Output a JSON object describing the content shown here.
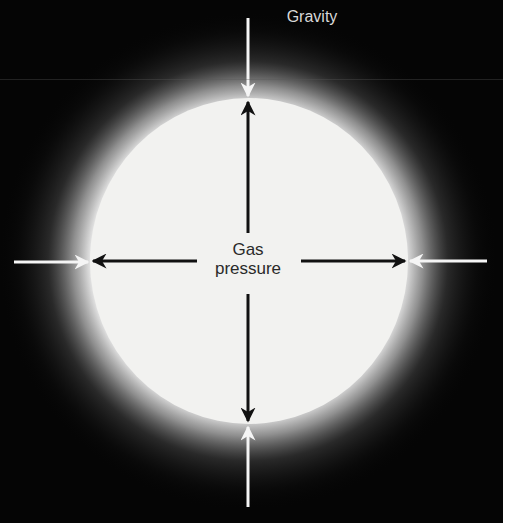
{
  "diagram": {
    "labels": {
      "gravity": "Gravity",
      "gas_pressure_line1": "Gas",
      "gas_pressure_line2": "pressure"
    },
    "star": {
      "shape": "circle",
      "fill": "#f2f2f0",
      "glow": "white halo fading to black"
    },
    "arrows": {
      "gravity": {
        "color": "#f5f5f5",
        "direction": "inward",
        "count": 4,
        "positions": [
          "top",
          "right",
          "bottom",
          "left"
        ]
      },
      "gas_pressure": {
        "color": "#111111",
        "direction": "outward",
        "count": 4,
        "positions": [
          "up",
          "right",
          "down",
          "left"
        ]
      }
    },
    "colors": {
      "background": "#050505",
      "star": "#f2f2f0",
      "gravity_arrow": "#f5f5f5",
      "pressure_arrow": "#111111",
      "gravity_text": "#d8d8d8",
      "pressure_text": "#2a2a2a"
    }
  }
}
